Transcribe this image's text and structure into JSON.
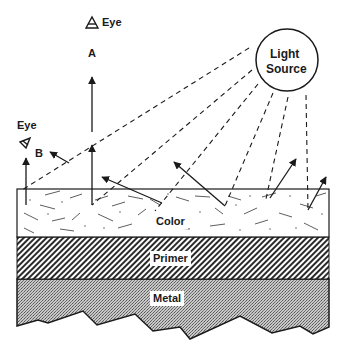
{
  "diagram": {
    "light_source": {
      "line1": "Light",
      "line2": "Source"
    },
    "observers": [
      {
        "id": "A",
        "eye_label": "Eye",
        "letter": "A"
      },
      {
        "id": "B",
        "eye_label": "Eye",
        "letter": "B"
      }
    ],
    "layers": [
      {
        "name": "Color",
        "label": "Color",
        "pattern": "random flakes"
      },
      {
        "name": "Primer",
        "label": "Primer",
        "pattern": "diagonal hatch"
      },
      {
        "name": "Metal",
        "label": "Metal",
        "pattern": "stipple"
      }
    ],
    "colors": {
      "ink": "#1a1a1a",
      "background": "#ffffff",
      "metal_fill": "#9a9a9a"
    }
  }
}
